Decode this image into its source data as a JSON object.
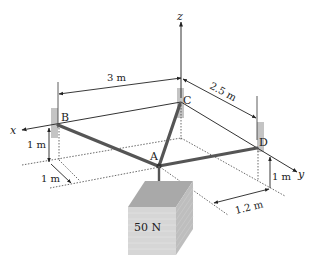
{
  "diagram": {
    "type": "statics-3d-cable-system",
    "axes": {
      "x": "x",
      "y": "y",
      "z": "z"
    },
    "points": {
      "A": "A",
      "B": "B",
      "C": "C",
      "D": "D"
    },
    "dimensions": {
      "BC": "3 m",
      "CD": "2.5 m",
      "B_height": "1 m",
      "B_offset": "1 m",
      "D_height": "1 m",
      "D_offset": "1.2 m"
    },
    "load": {
      "label": "50 N"
    },
    "colors": {
      "cable": "#555555",
      "line": "#222222",
      "support": "#bfbfbf",
      "crate_front": "#d4d4d4",
      "crate_top": "#a8a8a8",
      "crate_side": "#bcbcbc"
    }
  }
}
